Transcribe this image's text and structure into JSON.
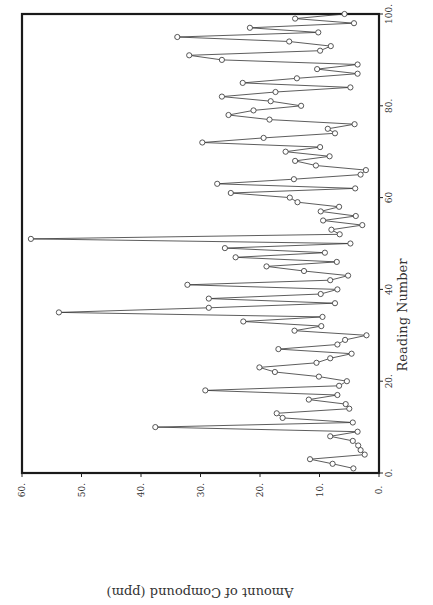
{
  "chart_data": {
    "type": "line",
    "title": "",
    "xlabel": "Reading Number",
    "ylabel": "Amount of Compound (ppm)",
    "orientation": "rotated 90 degrees clockwise (x-axis vertical on right, y-axis horizontal at bottom)",
    "xlim": [
      0,
      100
    ],
    "ylim": [
      0,
      60
    ],
    "x_ticks": [
      "0.",
      "20.",
      "40",
      "60",
      "80.",
      "100."
    ],
    "y_ticks": [
      "0.",
      "10.",
      "20.",
      "30.",
      "40.",
      "50.",
      "60."
    ],
    "markers": "open circles",
    "grid": false,
    "legend": null,
    "x": [
      1,
      2,
      3,
      4,
      5,
      6,
      7,
      8,
      9,
      10,
      11,
      12,
      13,
      14,
      15,
      16,
      17,
      18,
      19,
      20,
      21,
      22,
      23,
      24,
      25,
      26,
      27,
      28,
      29,
      30,
      31,
      32,
      33,
      34,
      35,
      36,
      37,
      38,
      39,
      40,
      41,
      42,
      43,
      44,
      45,
      46,
      47,
      48,
      49,
      50,
      51,
      52,
      53,
      54,
      55,
      56,
      57,
      58,
      59,
      60,
      61,
      62,
      63,
      64,
      65,
      66,
      67,
      68,
      69,
      70,
      71,
      72,
      73,
      74,
      75,
      76,
      77,
      78,
      79,
      80,
      81,
      82,
      83,
      84,
      85,
      86,
      87,
      88,
      89,
      90,
      91,
      92,
      93,
      94,
      95,
      96,
      97,
      98,
      99,
      100
    ],
    "series": [
      {
        "name": "Amount of Compound",
        "values": [
          4.3,
          7.8,
          11.6,
          2.4,
          3.1,
          3.5,
          4.4,
          8.2,
          3.6,
          37.6,
          4.4,
          16.2,
          17.2,
          5.0,
          5.6,
          11.8,
          7.0,
          29.2,
          6.7,
          5.4,
          10.1,
          17.5,
          20.1,
          10.5,
          8.2,
          4.6,
          16.9,
          7.0,
          5.7,
          2.1,
          14.2,
          9.7,
          22.8,
          9.5,
          53.8,
          28.6,
          7.4,
          28.6,
          9.8,
          7.0,
          32.2,
          8.2,
          5.2,
          12.6,
          18.9,
          7.1,
          24.1,
          9.1,
          25.9,
          4.8,
          58.5,
          6.6,
          8.0,
          2.8,
          9.4,
          3.9,
          9.8,
          6.7,
          13.7,
          15.0,
          24.9,
          4.0,
          27.2,
          14.3,
          3.1,
          2.2,
          10.6,
          14.1,
          8.3,
          15.7,
          9.9,
          29.7,
          19.4,
          7.4,
          8.6,
          4.1,
          18.4,
          25.3,
          21.1,
          13.1,
          18.2,
          26.4,
          17.4,
          4.8,
          22.9,
          13.8,
          3.6,
          10.4,
          3.6,
          26.4,
          31.9,
          9.9,
          8.1,
          15.1,
          33.9,
          10.2,
          21.7,
          4.2,
          14.1,
          5.8
        ]
      }
    ]
  }
}
